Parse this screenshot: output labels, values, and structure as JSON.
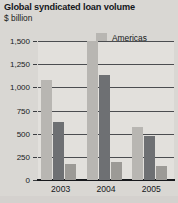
{
  "chart_data": {
    "type": "bar",
    "title": "Global syndicated loan volume",
    "subtitle": "$ billion",
    "xlabel": "",
    "ylabel": "",
    "categories": [
      "2003",
      "2004",
      "2005"
    ],
    "series": [
      {
        "name": "Americas",
        "color": "#b8b6b2",
        "values": [
          1075,
          1690,
          570
        ]
      },
      {
        "name": "EMEA",
        "color": "#6e7073",
        "values": [
          630,
          1130,
          480
        ]
      },
      {
        "name": "Asia Pacific",
        "color": "#9c9a96",
        "values": [
          170,
          195,
          150
        ]
      }
    ],
    "ylim": [
      0,
      1500
    ],
    "yticks": [
      0,
      250,
      500,
      750,
      1000,
      1250,
      1500
    ],
    "ytick_labels": [
      "0",
      "250",
      "500",
      "750",
      "1,000",
      "1,250",
      "1,500"
    ],
    "grid": true,
    "legend_position": "top-right"
  }
}
